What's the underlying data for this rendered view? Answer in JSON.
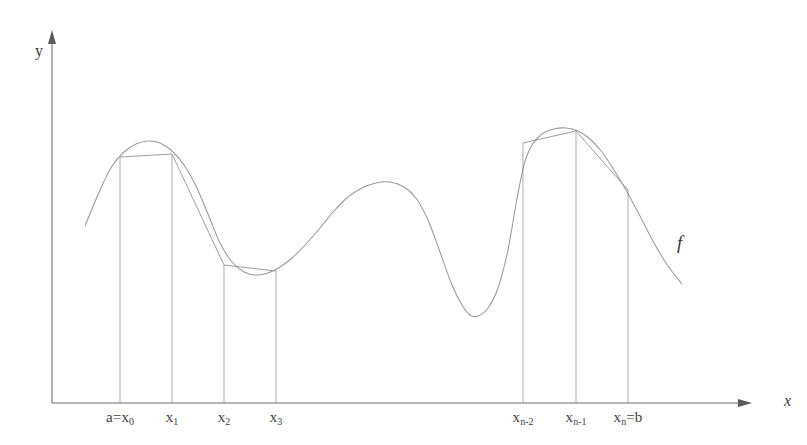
{
  "figure": {
    "background_color": "#ffffff",
    "curve_color": "#9a9a9a",
    "chord_color": "#9d9d9d",
    "axis_color": "#6d6d6d",
    "ordinate_color": "#a8a8a8",
    "label_color": "#3e3e3e"
  },
  "axes": {
    "y_label": "y",
    "x_label": "x",
    "origin": {
      "x": 52,
      "y": 403
    },
    "x_axis_end": {
      "x": 752,
      "y": 403
    },
    "y_axis_top": {
      "x": 52,
      "y": 30
    }
  },
  "function_label": {
    "text": "f",
    "x": 677,
    "y": 245
  },
  "tick_labels": [
    {
      "name": "x0",
      "text": "a=x",
      "sub": "0",
      "x": 120
    },
    {
      "name": "x1",
      "text": "x",
      "sub": "1",
      "x": 172
    },
    {
      "name": "x2",
      "text": "x",
      "sub": "2",
      "x": 224
    },
    {
      "name": "x3",
      "text": "x",
      "sub": "3",
      "x": 276
    },
    {
      "name": "xn-2",
      "text": "x",
      "sub": "n-2",
      "x": 523
    },
    {
      "name": "xn-1",
      "text": "x",
      "sub": "n-1",
      "x": 576
    },
    {
      "name": "xn",
      "text": "x",
      "sub": "n",
      "suffix": "=b",
      "x": 628
    }
  ],
  "chart_data": {
    "type": "line",
    "xlabel": "x",
    "ylabel": "y",
    "grid": false,
    "legend": null,
    "annotations": [
      "f"
    ],
    "partition_points": [
      {
        "label": "a=x_0",
        "x": 120,
        "y": 157
      },
      {
        "label": "x_1",
        "x": 172,
        "y": 154
      },
      {
        "label": "x_2",
        "x": 224,
        "y": 265
      },
      {
        "label": "x_3",
        "x": 276,
        "y": 271
      },
      {
        "label": "x_n-2",
        "x": 523,
        "y": 143
      },
      {
        "label": "x_n-1",
        "x": 576,
        "y": 131
      },
      {
        "label": "x_n=b",
        "x": 628,
        "y": 190
      }
    ],
    "curve_points": [
      [
        85,
        226
      ],
      [
        100,
        190
      ],
      [
        112,
        166
      ],
      [
        124,
        152
      ],
      [
        136,
        144
      ],
      [
        148,
        141
      ],
      [
        160,
        143
      ],
      [
        172,
        151
      ],
      [
        184,
        165
      ],
      [
        196,
        186
      ],
      [
        208,
        214
      ],
      [
        220,
        243
      ],
      [
        232,
        262
      ],
      [
        244,
        272
      ],
      [
        256,
        275
      ],
      [
        268,
        273
      ],
      [
        280,
        267
      ],
      [
        292,
        258
      ],
      [
        306,
        244
      ],
      [
        320,
        228
      ],
      [
        334,
        211
      ],
      [
        348,
        197
      ],
      [
        362,
        188
      ],
      [
        376,
        183
      ],
      [
        390,
        182
      ],
      [
        404,
        187
      ],
      [
        416,
        198
      ],
      [
        428,
        220
      ],
      [
        440,
        252
      ],
      [
        452,
        285
      ],
      [
        462,
        305
      ],
      [
        470,
        315
      ],
      [
        478,
        316
      ],
      [
        488,
        308
      ],
      [
        498,
        288
      ],
      [
        508,
        250
      ],
      [
        516,
        204
      ],
      [
        524,
        165
      ],
      [
        532,
        145
      ],
      [
        542,
        134
      ],
      [
        554,
        129
      ],
      [
        566,
        128
      ],
      [
        578,
        131
      ],
      [
        590,
        139
      ],
      [
        602,
        152
      ],
      [
        614,
        170
      ],
      [
        626,
        190
      ],
      [
        640,
        216
      ],
      [
        654,
        243
      ],
      [
        668,
        266
      ],
      [
        682,
        284
      ]
    ],
    "chords": [
      [
        [
          120,
          157
        ],
        [
          172,
          154
        ]
      ],
      [
        [
          172,
          154
        ],
        [
          224,
          265
        ]
      ],
      [
        [
          224,
          265
        ],
        [
          276,
          271
        ]
      ],
      [
        [
          523,
          143
        ],
        [
          576,
          131
        ]
      ],
      [
        [
          576,
          131
        ],
        [
          628,
          190
        ]
      ]
    ],
    "ordinates": [
      {
        "x": 120,
        "y_top": 157
      },
      {
        "x": 172,
        "y_top": 154
      },
      {
        "x": 224,
        "y_top": 265
      },
      {
        "x": 276,
        "y_top": 271
      },
      {
        "x": 523,
        "y_top": 143
      },
      {
        "x": 576,
        "y_top": 131
      },
      {
        "x": 628,
        "y_top": 190
      }
    ],
    "x_axis_y": 403
  }
}
